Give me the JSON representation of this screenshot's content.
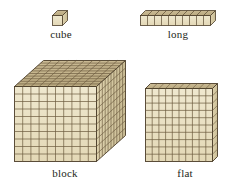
{
  "figure": {
    "background_color": "#ffffff",
    "line_color": "#5a4a32",
    "dark_line_color": "#3b2f1e",
    "colors": {
      "front_face": "#ece3c8",
      "front_face_alt": "#e4dabb",
      "top_face": "#c8b893",
      "top_face_alt": "#b8a87f",
      "side_face": "#d8cca8",
      "side_face_alt": "#cabd95",
      "outline": "#4a3c28",
      "label_text": "#231f20"
    }
  },
  "items": [
    {
      "name": "cube",
      "label": "cube",
      "units": 1,
      "dimensions": "1 x 1 x 1",
      "position": "top-left"
    },
    {
      "name": "long",
      "label": "long",
      "units": 10,
      "dimensions": "10 x 1 x 1",
      "position": "top-right",
      "cube_count": 10
    },
    {
      "name": "block",
      "label": "block",
      "units": 1000,
      "dimensions": "10 x 10 x 10",
      "position": "bottom-left",
      "grid_rows": 10,
      "grid_cols": 10
    },
    {
      "name": "flat",
      "label": "flat",
      "units": 100,
      "dimensions": "10 x 10 x 1",
      "position": "bottom-right",
      "grid_rows": 10,
      "grid_cols": 10
    }
  ]
}
